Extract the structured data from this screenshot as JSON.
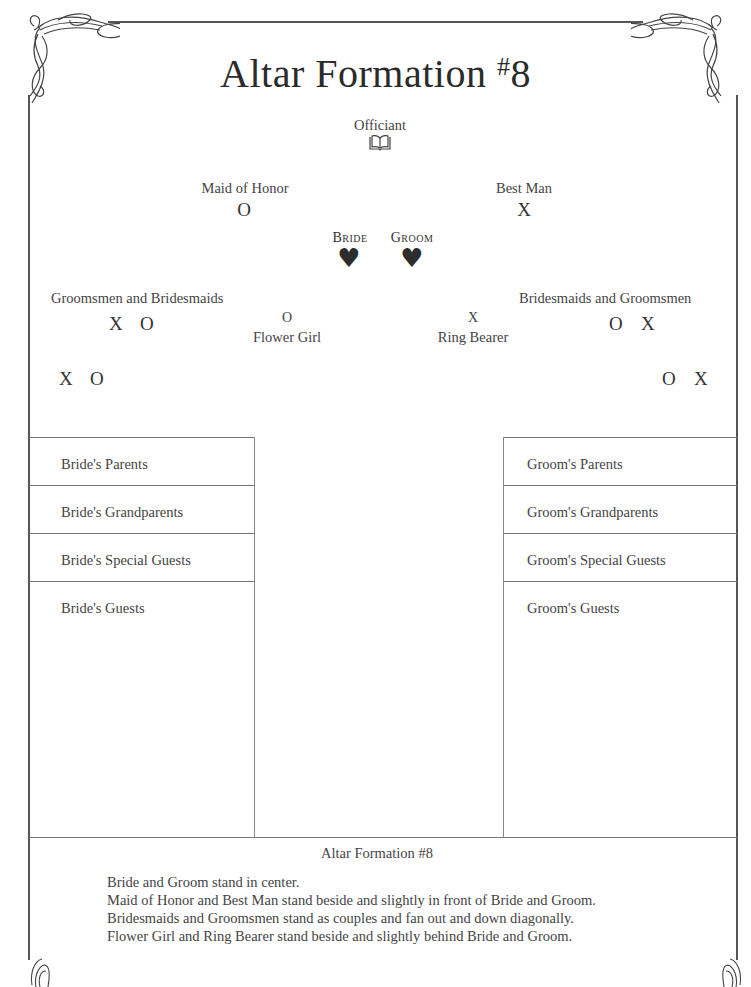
{
  "title": {
    "text": "Altar Formation ",
    "number_sup": "#",
    "number": "8"
  },
  "officiant": {
    "label": "Officiant",
    "icon": "open-book-icon"
  },
  "maid_of_honor": {
    "label": "Maid of Honor",
    "mark": "O"
  },
  "best_man": {
    "label": "Best Man",
    "mark": "X"
  },
  "bride": {
    "label": "Bride",
    "icon": "heart-icon",
    "glyph": "♥"
  },
  "groom": {
    "label": "Groom",
    "icon": "heart-icon",
    "glyph": "♥"
  },
  "left_party": {
    "label": "Groomsmen and Bridesmaids",
    "row1": [
      "X",
      "O"
    ],
    "row2": [
      "X",
      "O"
    ]
  },
  "right_party": {
    "label": "Bridesmaids and Groomsmen",
    "row1": [
      "O",
      "X"
    ],
    "row2": [
      "O",
      "X"
    ]
  },
  "flower_girl": {
    "label": "Flower Girl",
    "mark": "O"
  },
  "ring_bearer": {
    "label": "Ring Bearer",
    "mark": "X"
  },
  "bride_side": {
    "rows": [
      "Bride's Parents",
      "Bride's Grandparents",
      "Bride's Special Guests",
      "Bride's Guests"
    ]
  },
  "groom_side": {
    "rows": [
      "Groom's Parents",
      "Groom's Grandparents",
      "Groom's Special Guests",
      "Groom's Guests"
    ]
  },
  "footer": {
    "caption": "Altar Formation #8",
    "notes": [
      "Bride and Groom stand in center.",
      "Maid of Honor and Best Man stand beside and slightly in front of Bride and Groom.",
      "Bridesmaids and Groomsmen stand as couples and fan out and down diagonally.",
      "Flower Girl and Ring Bearer stand beside and slightly behind Bride and Groom."
    ]
  },
  "colors": {
    "border": "#555555",
    "text": "#3a3a3a"
  }
}
